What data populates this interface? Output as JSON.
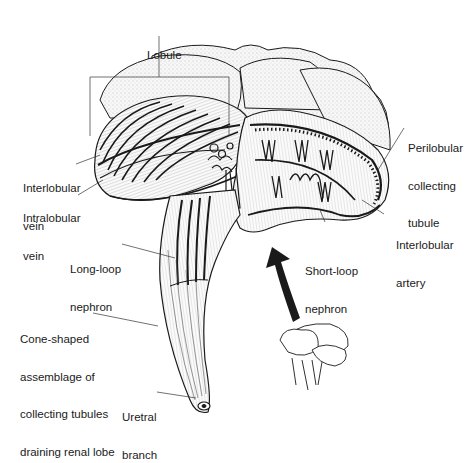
{
  "figure": {
    "labels": {
      "lobule": [
        "Lobule"
      ],
      "interlobular_vein": [
        "Interlobular",
        "vein"
      ],
      "intralobular_vein": [
        "Intralobular",
        "vein"
      ],
      "perilobular_collecting_tubule": [
        "Perilobular",
        "collecting",
        "tubule"
      ],
      "interlobular_artery": [
        "Interlobular",
        "artery"
      ],
      "long_loop_nephron": [
        "Long-loop",
        "nephron"
      ],
      "short_loop_nephron": [
        "Short-loop",
        "nephron"
      ],
      "cone_shaped": [
        "Cone-shaped",
        "assemblage of",
        "collecting tubules",
        "draining renal lobe"
      ],
      "uretral_branch": [
        "Uretral",
        "branch"
      ]
    },
    "colors": {
      "ink": "#1a1a1a",
      "fill": "#f2f2f2",
      "shade": "#d9d9d9",
      "background": "#ffffff"
    }
  }
}
